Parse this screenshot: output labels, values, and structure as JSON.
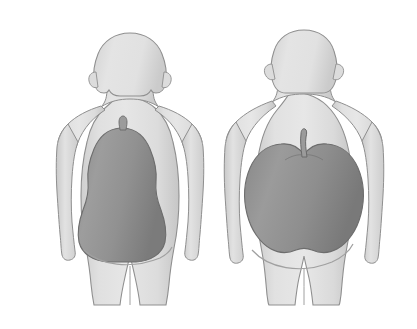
{
  "illustration": {
    "title": "Body shape comparison: pear-shaped and apple-shaped obesity",
    "background_color": "#ffffff",
    "width": 417,
    "height": 329
  },
  "palette": {
    "body_fill_light": "#e2e2e2",
    "body_fill_mid": "#d3d3d3",
    "body_fill_shadow": "#bfbfbf",
    "body_outline": "#8f8f8f",
    "fruit_fill_light": "#9a9a9a",
    "fruit_fill_dark": "#7d7d7d",
    "fruit_outline": "#6d6d6d",
    "stem_fill": "#9b9b9b",
    "stem_outline": "#6a6a6a",
    "crease_line": "#a0a0a0"
  },
  "figures": [
    {
      "id": "left-figure",
      "label": "pear-shaped-body",
      "sex": "female",
      "fruit": "pear",
      "fruit_label": "pear-overlay",
      "description": "Female silhouette with weight carried in hips and thighs",
      "stem": "short-stub-stem",
      "bbox": {
        "x": 55,
        "y": 30,
        "width": 130,
        "height": 278
      }
    },
    {
      "id": "right-figure",
      "label": "apple-shaped-body",
      "sex": "male",
      "fruit": "apple",
      "fruit_label": "apple-overlay",
      "description": "Male silhouette with weight carried around the abdomen",
      "stem": "long-curved-stem",
      "bbox": {
        "x": 222,
        "y": 28,
        "width": 136,
        "height": 278
      }
    }
  ]
}
